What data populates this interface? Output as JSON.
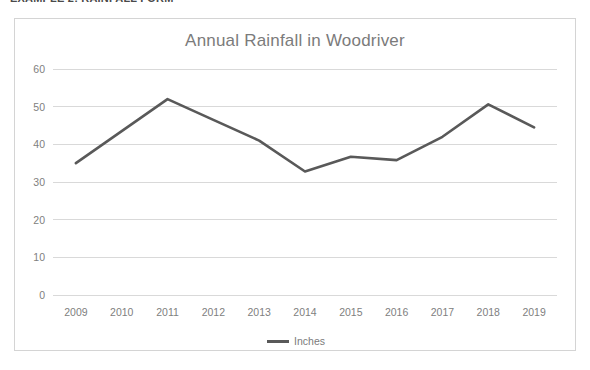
{
  "document": {
    "header_text": "EXAMPLE 2: RAINFALL FORM"
  },
  "chart_data": {
    "type": "line",
    "title": "Annual Rainfall in Woodriver",
    "xlabel": "",
    "ylabel": "",
    "categories": [
      "2009",
      "2010",
      "2011",
      "2012",
      "2013",
      "2014",
      "2015",
      "2016",
      "2017",
      "2018",
      "2019"
    ],
    "series": [
      {
        "name": "Inches",
        "values": [
          35,
          43.5,
          52,
          46.5,
          41,
          32.8,
          36.7,
          35.8,
          42,
          50.6,
          44.5
        ],
        "color": "#595959"
      }
    ],
    "ylim": [
      0,
      60
    ],
    "ytick_step": 10,
    "yticks": [
      "0",
      "10",
      "20",
      "30",
      "40",
      "50",
      "60"
    ],
    "grid": true,
    "grid_color": "#d9d9d9",
    "legend": {
      "position": "bottom",
      "entries": [
        "Inches"
      ]
    },
    "axis_text_color": "#808080",
    "title_color": "#7b7b7b",
    "border_color": "#d4d4d4"
  }
}
